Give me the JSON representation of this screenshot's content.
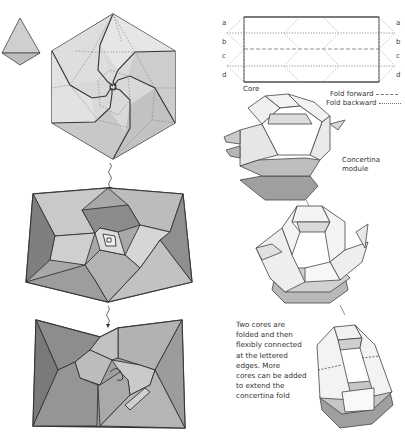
{
  "figure": {
    "colors": {
      "paper_light": "#e4e4e4",
      "paper_mid": "#c4c4c4",
      "paper_dark": "#9a9a9a",
      "paper_darker": "#7d7d7d",
      "outline": "#333333",
      "fold_line": "#666666"
    }
  },
  "core_diagram": {
    "label": "Core",
    "left_edge_letters": [
      "a",
      "b",
      "c",
      "d"
    ],
    "right_edge_letters": [
      "a",
      "b",
      "c",
      "d"
    ]
  },
  "legend": {
    "fold_forward": "Fold forward",
    "fold_backward": "Fold backward"
  },
  "concertina": {
    "module_label_line1": "Concertina",
    "module_label_line2": "module"
  },
  "caption": {
    "lines": [
      "Two cores are",
      "folded and then",
      "flexibly connected",
      "at the lettered",
      "edges. More",
      "cores can be added",
      "to extend the",
      "concertina fold"
    ]
  },
  "steps": {
    "left_column": [
      "unit-triangle",
      "spiral-hexagon-crease-pattern",
      "twisted-hexagon-step-1",
      "twisted-hexagon-step-2"
    ],
    "right_column": [
      "core-strip",
      "concertina-module",
      "connected-cores",
      "extended-concertina"
    ]
  }
}
